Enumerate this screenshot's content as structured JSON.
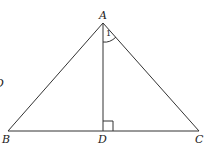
{
  "diagram": {
    "type": "geometry",
    "title": "",
    "points": {
      "A": {
        "label": "A",
        "x": 103,
        "y": 23
      },
      "B": {
        "label": "B",
        "x": 8,
        "y": 131
      },
      "C": {
        "label": "C",
        "x": 199,
        "y": 131
      },
      "D": {
        "label": "D",
        "x": 103,
        "y": 131
      }
    },
    "segments": [
      "AB",
      "AC",
      "BC",
      "AD"
    ],
    "right_angle_marker": "D",
    "angle_marks": [
      {
        "at": "A",
        "between": [
          "AD",
          "AC"
        ],
        "label": "1"
      }
    ],
    "edge_fragment_text": "D"
  },
  "labels": {
    "A": "A",
    "B": "B",
    "C": "C",
    "D": "D",
    "angle1": "1",
    "edge_fragment": "D"
  },
  "colors": {
    "stroke": "#333333",
    "text": "#222222",
    "background": "#ffffff"
  }
}
